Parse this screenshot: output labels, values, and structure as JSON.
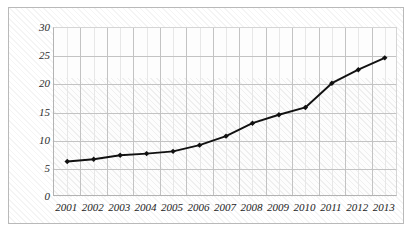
{
  "chart_data": {
    "type": "line",
    "title": "",
    "xlabel": "",
    "ylabel": "",
    "categories": [
      "2001",
      "2002",
      "2003",
      "2004",
      "2005",
      "2006",
      "2007",
      "2008",
      "2009",
      "2010",
      "2011",
      "2012",
      "2013"
    ],
    "values": [
      6.3,
      6.7,
      7.4,
      7.7,
      8.1,
      9.2,
      10.8,
      13.1,
      14.6,
      15.9,
      20.2,
      22.6,
      24.7
    ],
    "series": [
      {
        "name": "",
        "values": [
          6.3,
          6.7,
          7.4,
          7.7,
          8.1,
          9.2,
          10.8,
          13.1,
          14.6,
          15.9,
          20.2,
          22.6,
          24.7
        ]
      }
    ],
    "ylim": [
      0,
      30
    ],
    "yticks": [
      0,
      5,
      10,
      15,
      20,
      25,
      30
    ],
    "ytick_labels": [
      "0",
      "5",
      "10",
      "15",
      "20",
      "25",
      "30"
    ],
    "xtick_labels": [
      "2001",
      "2002",
      "2003",
      "2004",
      "2005",
      "2006",
      "2007",
      "2008",
      "2009",
      "2010",
      "2011",
      "2012",
      "2013"
    ],
    "grid": true,
    "legend": null,
    "legend_position": "none",
    "annotations": [],
    "marker": "diamond",
    "line_color": "#111111",
    "marker_color": "#111111",
    "plot_background": "#fdfdfd",
    "grid_color": "#c3c3c3",
    "frame_color": "#b9b9b9"
  }
}
